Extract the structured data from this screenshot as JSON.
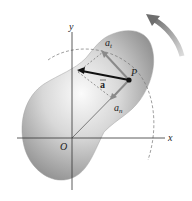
{
  "diagram": {
    "labels": {
      "x_axis": "x",
      "y_axis": "y",
      "origin": "O",
      "point": "P",
      "accel": "a",
      "tangential": "a",
      "tangential_sub": "t",
      "normal": "a",
      "normal_sub": "n"
    },
    "colors": {
      "body": "#9a9a9a",
      "body_light": "#f4f4f4",
      "arrow": "#8a8a8a",
      "axis": "#333333"
    }
  }
}
